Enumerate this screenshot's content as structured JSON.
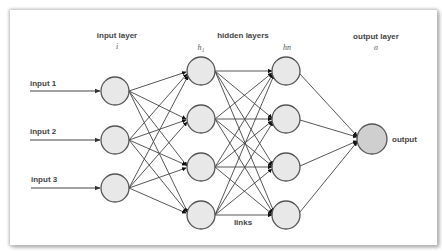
{
  "diagram": {
    "type": "neural-network",
    "layers": {
      "input": {
        "title": "input layer",
        "symbol": "i"
      },
      "hidden": {
        "title": "hidden layers",
        "first_symbol": "h1",
        "first_symbol_display": "h₁",
        "last_symbol": "hn",
        "last_symbol_display": "hn"
      },
      "output": {
        "title": "output layer",
        "symbol": "σ"
      }
    },
    "inputs": [
      {
        "label": "input 1"
      },
      {
        "label": "input 2"
      },
      {
        "label": "input 3"
      }
    ],
    "output_label": "output",
    "links_label": "links",
    "node_counts": {
      "input": 3,
      "hidden_1": 4,
      "hidden_n": 4,
      "output": 1
    },
    "colors": {
      "node_fill": "#e8e8e8",
      "output_fill": "#cfcfcf",
      "stroke": "#555555",
      "edge": "#444444",
      "arrow": "#111111"
    }
  }
}
